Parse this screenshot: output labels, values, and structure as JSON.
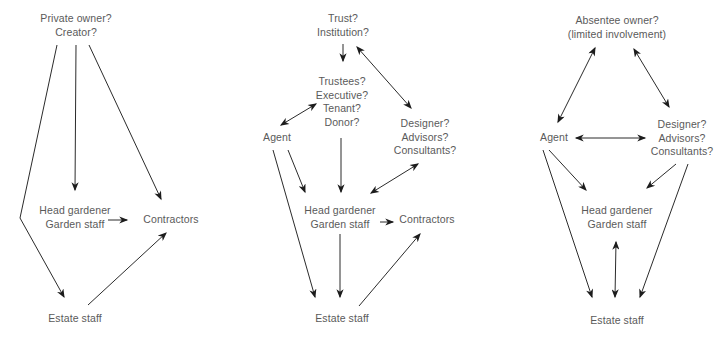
{
  "page": {
    "background_color": "#ffffff",
    "text_color": "#5a5a5a",
    "line_color": "#2b2b2b",
    "arrow_color": "#1c1c1c"
  },
  "diagrams": [
    {
      "id": "private-owner-structure",
      "nodes": {
        "owner": {
          "lines": [
            "Private owner?",
            "Creator?"
          ]
        },
        "head_gardener": {
          "lines": [
            "Head gardener",
            "Garden staff"
          ]
        },
        "contractors": {
          "lines": [
            "Contractors"
          ]
        },
        "estate_staff": {
          "lines": [
            "Estate staff"
          ]
        }
      },
      "edges": [
        {
          "from": "owner",
          "to": "estate_staff",
          "arrow": "single"
        },
        {
          "from": "owner",
          "to": "head_gardener",
          "arrow": "single"
        },
        {
          "from": "owner",
          "to": "contractors",
          "arrow": "single"
        },
        {
          "from": "head_gardener",
          "to": "contractors",
          "arrow": "single"
        },
        {
          "from": "estate_staff",
          "to": "contractors",
          "arrow": "single"
        }
      ]
    },
    {
      "id": "trust-institution-structure",
      "nodes": {
        "trust": {
          "lines": [
            "Trust?",
            "Institution?"
          ]
        },
        "trustees": {
          "lines": [
            "Trustees?",
            "Executive?",
            "Tenant?",
            "Donor?"
          ]
        },
        "agent": {
          "lines": [
            "Agent"
          ]
        },
        "designer": {
          "lines": [
            "Designer?",
            "Advisors?",
            "Consultants?"
          ]
        },
        "head_gardener": {
          "lines": [
            "Head gardener",
            "Garden staff"
          ]
        },
        "contractors": {
          "lines": [
            "Contractors"
          ]
        },
        "estate_staff": {
          "lines": [
            "Estate staff"
          ]
        }
      },
      "edges": [
        {
          "from": "trust",
          "to": "trustees",
          "arrow": "single"
        },
        {
          "from": "trust",
          "to": "designer",
          "arrow": "double"
        },
        {
          "from": "trustees",
          "to": "agent",
          "arrow": "double"
        },
        {
          "from": "agent",
          "to": "head_gardener",
          "arrow": "single"
        },
        {
          "from": "agent",
          "to": "estate_staff",
          "arrow": "single"
        },
        {
          "from": "trustees",
          "to": "head_gardener",
          "arrow": "single"
        },
        {
          "from": "designer",
          "to": "head_gardener",
          "arrow": "double"
        },
        {
          "from": "head_gardener",
          "to": "contractors",
          "arrow": "single"
        },
        {
          "from": "head_gardener",
          "to": "estate_staff",
          "arrow": "single"
        },
        {
          "from": "estate_staff",
          "to": "contractors",
          "arrow": "single"
        }
      ]
    },
    {
      "id": "absentee-owner-structure",
      "nodes": {
        "owner": {
          "lines": [
            "Absentee owner?",
            "(limited involvement)"
          ]
        },
        "agent": {
          "lines": [
            "Agent"
          ]
        },
        "designer": {
          "lines": [
            "Designer?",
            "Advisors?",
            "Consultants?"
          ]
        },
        "head_gardener": {
          "lines": [
            "Head gardener",
            "Garden staff"
          ]
        },
        "estate_staff": {
          "lines": [
            "Estate staff"
          ]
        }
      },
      "edges": [
        {
          "from": "owner",
          "to": "agent",
          "arrow": "double"
        },
        {
          "from": "owner",
          "to": "designer",
          "arrow": "double"
        },
        {
          "from": "agent",
          "to": "designer",
          "arrow": "double"
        },
        {
          "from": "agent",
          "to": "head_gardener",
          "arrow": "single"
        },
        {
          "from": "agent",
          "to": "estate_staff",
          "arrow": "single"
        },
        {
          "from": "designer",
          "to": "head_gardener",
          "arrow": "single"
        },
        {
          "from": "designer",
          "to": "estate_staff",
          "arrow": "single"
        },
        {
          "from": "head_gardener",
          "to": "estate_staff",
          "arrow": "double"
        }
      ]
    }
  ]
}
